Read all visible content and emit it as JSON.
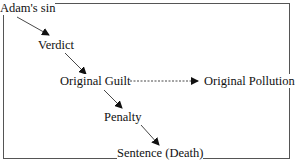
{
  "diagram": {
    "nodes": [
      {
        "id": "adams_sin",
        "label": "Adam's sin"
      },
      {
        "id": "verdict",
        "label": "Verdict"
      },
      {
        "id": "original_guilt",
        "label": "Original Guilt"
      },
      {
        "id": "original_pollution",
        "label": "Original Pollution"
      },
      {
        "id": "penalty",
        "label": "Penalty"
      },
      {
        "id": "sentence",
        "label": "Sentence (Death)"
      }
    ],
    "edges": [
      {
        "from": "adams_sin",
        "to": "verdict",
        "style": "solid"
      },
      {
        "from": "verdict",
        "to": "original_guilt",
        "style": "solid"
      },
      {
        "from": "original_guilt",
        "to": "original_pollution",
        "style": "dashed"
      },
      {
        "from": "original_guilt",
        "to": "penalty",
        "style": "solid"
      },
      {
        "from": "penalty",
        "to": "sentence",
        "style": "solid"
      }
    ]
  }
}
